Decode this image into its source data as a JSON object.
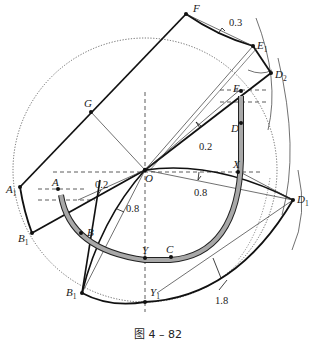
{
  "figure": {
    "caption": "图 4 – 82",
    "points": {
      "F": {
        "label": "F"
      },
      "E1": {
        "label": "E",
        "sub": "1"
      },
      "D2": {
        "label": "D",
        "sub": "2"
      },
      "E": {
        "label": "E"
      },
      "D": {
        "label": "D"
      },
      "G": {
        "label": "G"
      },
      "O": {
        "label": "O"
      },
      "X": {
        "label": "X"
      },
      "A1": {
        "label": "A",
        "sub": "1"
      },
      "A": {
        "label": "A"
      },
      "B1_left": {
        "label": "B",
        "sub": "1"
      },
      "B": {
        "label": "B"
      },
      "Y": {
        "label": "Y"
      },
      "C": {
        "label": "C"
      },
      "D1": {
        "label": "D",
        "sub": "1"
      },
      "B1_bottom": {
        "label": "B",
        "sub": "1"
      },
      "Y1": {
        "label": "Y",
        "sub": "1"
      }
    },
    "dimensions": {
      "fe1_offset": "0.3",
      "oe_offset": "0.2",
      "oa_offset": "0.2",
      "ob_offset": "0.8",
      "ox_offset": "0.8",
      "outer_curve_offset": "1.8"
    }
  }
}
